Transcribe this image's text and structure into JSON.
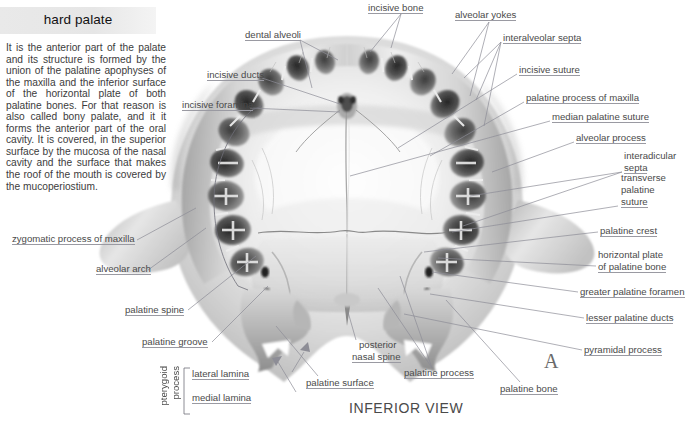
{
  "panel": {
    "title": "hard palate",
    "description": "It is the anterior part of the palate and its structure is formed by the union of the palatine apophyses of the maxilla and the inferior surface of the horizontal plate of both palatine bones. For that reason is also called bony palate, and it it forms the anterior part of the oral cavity. It is covered, in the superior surface by the mucosa of the nasal cavity and the surface that makes the roof of the mouth is covered by the mucoperiostium."
  },
  "figure": {
    "caption": "INFERIOR VIEW",
    "panel_marker": "A"
  },
  "labels": {
    "top": [
      {
        "id": "incisive-bone",
        "text": "incisive bone"
      },
      {
        "id": "alveolar-yokes",
        "text": "alveolar yokes"
      },
      {
        "id": "dental-alveoli",
        "text": "dental alveoli"
      },
      {
        "id": "incisive-ducts",
        "text": "incisive ducts"
      },
      {
        "id": "incisive-foramina",
        "text": "incisive foramina"
      }
    ],
    "right": [
      {
        "id": "interalveolar-septa",
        "text": "interalveolar septa"
      },
      {
        "id": "incisive-suture",
        "text": "incisive suture"
      },
      {
        "id": "palatine-process-of-maxilla",
        "text": "palatine process of maxilla"
      },
      {
        "id": "median-palatine-suture",
        "text": "median palatine suture"
      },
      {
        "id": "alveolar-process",
        "text": "alveolar process"
      },
      {
        "id": "interadicular-septa-line1",
        "text": "interadicular"
      },
      {
        "id": "interadicular-septa-line2",
        "text": "septa"
      },
      {
        "id": "transverse-palatine-suture-line1",
        "text": "transverse"
      },
      {
        "id": "transverse-palatine-suture-line2",
        "text": "palatine"
      },
      {
        "id": "transverse-palatine-suture-line3",
        "text": "suture"
      },
      {
        "id": "palatine-crest",
        "text": "palatine crest"
      },
      {
        "id": "horizontal-plate-line1",
        "text": "horizontal plate"
      },
      {
        "id": "horizontal-plate-line2",
        "text": "of palatine bone"
      },
      {
        "id": "greater-palatine-foramen",
        "text": "greater palatine foramen"
      },
      {
        "id": "lesser-palatine-ducts",
        "text": "lesser palatine ducts"
      },
      {
        "id": "pyramidal-process",
        "text": "pyramidal process"
      }
    ],
    "left": [
      {
        "id": "zygomatic-process-of-maxilla",
        "text": "zygomatic process of maxilla"
      },
      {
        "id": "alveolar-arch",
        "text": "alveolar arch"
      },
      {
        "id": "palatine-spine",
        "text": "palatine spine"
      },
      {
        "id": "palatine-groove",
        "text": "palatine groove"
      },
      {
        "id": "lateral-lamina",
        "text": "lateral lamina"
      },
      {
        "id": "medial-lamina",
        "text": "medial lamina"
      },
      {
        "id": "pterygoid-process-line1",
        "text": "pterygoid"
      },
      {
        "id": "pterygoid-process-line2",
        "text": "process"
      }
    ],
    "bottom": [
      {
        "id": "posterior-nasal-spine-line1",
        "text": "posterior"
      },
      {
        "id": "posterior-nasal-spine-line2",
        "text": "nasal spine"
      },
      {
        "id": "palatine-surface",
        "text": "palatine surface"
      },
      {
        "id": "palatine-process",
        "text": "palatine process"
      },
      {
        "id": "palatine-bone",
        "text": "palatine bone"
      }
    ]
  },
  "colors": {
    "leader_line": "#8d8d96",
    "label_text": "#4a4a4a",
    "title_bg": "#e9e9e9",
    "bone_light": "#f6f6f6",
    "bone_mid": "#c8c8c8",
    "bone_dark": "#6e6e6e"
  }
}
